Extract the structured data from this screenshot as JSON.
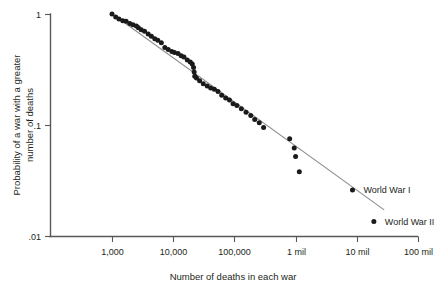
{
  "chart_data": {
    "type": "scatter",
    "title": "",
    "subtitle": "",
    "xlabel": "Number of deaths in each war",
    "ylabel": "Probability of a war with a greater number of deaths",
    "ylabel_line1": "Probability of a war with a greater",
    "ylabel_line2": "number of deaths",
    "xscale": "log",
    "yscale": "log",
    "xlim": [
      1000,
      100000000
    ],
    "ylim": [
      0.01,
      1
    ],
    "grid": false,
    "legend": "none",
    "x_tick_labels": [
      "1,000",
      "10,000",
      "100,000",
      "1 mil",
      "10 mil",
      "100 mil"
    ],
    "x_tick_values": [
      1000,
      10000,
      100000,
      1000000,
      10000000,
      100000000
    ],
    "y_tick_labels": [
      "1",
      ".1",
      ".01"
    ],
    "y_tick_values": [
      1,
      0.1,
      0.01
    ],
    "series": [
      {
        "name": "wars",
        "marker": "filled-circle",
        "color": "#1a1a1a",
        "points": [
          [
            1000,
            1.0
          ],
          [
            1150,
            0.94
          ],
          [
            1300,
            0.9
          ],
          [
            1500,
            0.87
          ],
          [
            1700,
            0.86
          ],
          [
            1950,
            0.82
          ],
          [
            2200,
            0.8
          ],
          [
            2500,
            0.78
          ],
          [
            2700,
            0.75
          ],
          [
            3000,
            0.72
          ],
          [
            3400,
            0.7
          ],
          [
            3900,
            0.66
          ],
          [
            4400,
            0.63
          ],
          [
            5000,
            0.6
          ],
          [
            5600,
            0.58
          ],
          [
            6400,
            0.55
          ],
          [
            7300,
            0.5
          ],
          [
            8300,
            0.48
          ],
          [
            9500,
            0.46
          ],
          [
            10500,
            0.45
          ],
          [
            12000,
            0.44
          ],
          [
            13500,
            0.42
          ],
          [
            15000,
            0.41
          ],
          [
            17000,
            0.385
          ],
          [
            19000,
            0.37
          ],
          [
            20500,
            0.355
          ],
          [
            21500,
            0.33
          ],
          [
            22000,
            0.3
          ],
          [
            22500,
            0.275
          ],
          [
            24000,
            0.265
          ],
          [
            27000,
            0.25
          ],
          [
            31000,
            0.235
          ],
          [
            36000,
            0.225
          ],
          [
            41000,
            0.215
          ],
          [
            47000,
            0.21
          ],
          [
            54000,
            0.2
          ],
          [
            62000,
            0.185
          ],
          [
            72000,
            0.175
          ],
          [
            83000,
            0.168
          ],
          [
            95000,
            0.155
          ],
          [
            110000,
            0.15
          ],
          [
            130000,
            0.14
          ],
          [
            155000,
            0.13
          ],
          [
            185000,
            0.122
          ],
          [
            215000,
            0.112
          ],
          [
            255000,
            0.105
          ],
          [
            300000,
            0.095
          ],
          [
            800000,
            0.075
          ],
          [
            950000,
            0.062
          ],
          [
            1000000,
            0.052
          ],
          [
            1150000,
            0.038
          ]
        ]
      },
      {
        "name": "world-wars",
        "marker": "filled-circle",
        "color": "#1a1a1a",
        "points": [
          [
            8500000,
            0.026
          ],
          [
            19000000,
            0.0135
          ]
        ]
      }
    ],
    "fit_line": {
      "name": "power-law fit",
      "color": "#8d8d90",
      "x_start": 1100,
      "y_start": 0.97,
      "x_end": 28000000,
      "y_end": 0.0172
    },
    "annotations": [
      {
        "text": "World War I",
        "x": 8500000,
        "y": 0.026
      },
      {
        "text": "World War II",
        "x": 19000000,
        "y": 0.0135
      }
    ]
  }
}
